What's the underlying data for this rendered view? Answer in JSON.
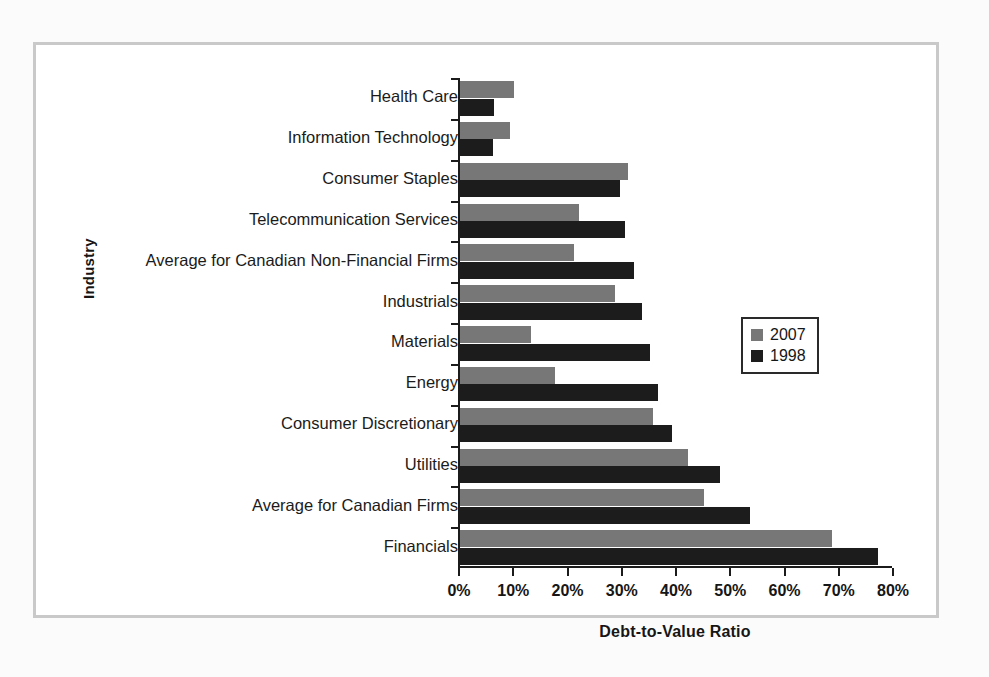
{
  "chart_data": {
    "type": "bar",
    "orientation": "horizontal",
    "title": "",
    "xlabel": "Debt-to-Value Ratio",
    "ylabel": "Industry",
    "xlim": [
      0,
      80
    ],
    "grid": false,
    "legend_position": "middle-right",
    "xtick_labels": [
      "0%",
      "10%",
      "20%",
      "30%",
      "40%",
      "50%",
      "60%",
      "70%",
      "80%"
    ],
    "xtick_values": [
      0,
      10,
      20,
      30,
      40,
      50,
      60,
      70,
      80
    ],
    "categories": [
      "Health Care",
      "Information Technology",
      "Consumer Staples",
      "Telecommunication Services",
      "Average for Canadian Non-Financial Firms",
      "Industrials",
      "Materials",
      "Energy",
      "Consumer Discretionary",
      "Utilities",
      "Average for Canadian Firms",
      "Financials"
    ],
    "series": [
      {
        "name": "2007",
        "color": "#777777",
        "values": [
          10,
          9.3,
          31,
          22,
          21,
          28.5,
          13,
          17.5,
          35.5,
          42,
          45,
          68.5
        ]
      },
      {
        "name": "1998",
        "color": "#1c1c1c",
        "values": [
          6.3,
          6,
          29.5,
          30.5,
          32,
          33.5,
          35,
          36.5,
          39,
          48,
          53.5,
          77
        ]
      }
    ]
  },
  "legend": {
    "entries": [
      {
        "label": "2007",
        "color": "#777777"
      },
      {
        "label": "1998",
        "color": "#1c1c1c"
      }
    ]
  },
  "colors": {
    "series_2007": "#777777",
    "series_1998": "#1c1c1c",
    "frame": "#c9c9c9",
    "axis": "#1b1b1b",
    "background": "#ffffff"
  }
}
